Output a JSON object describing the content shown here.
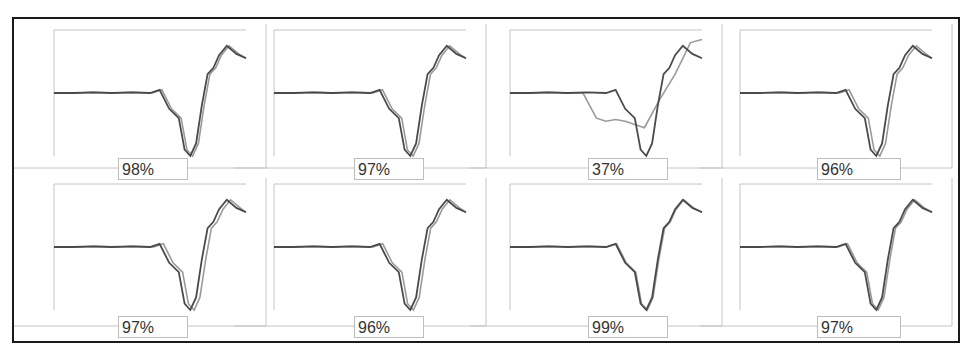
{
  "chart_data": {
    "type": "line",
    "title": "",
    "xlabel": "",
    "ylabel": "",
    "ylim": [
      -1,
      1
    ],
    "xlim": [
      0,
      1
    ],
    "grid": false,
    "legend": "none",
    "reference_shape": {
      "x": [
        0,
        0.1,
        0.2,
        0.3,
        0.4,
        0.5,
        0.55,
        0.6,
        0.65,
        0.68,
        0.71,
        0.74,
        0.77,
        0.8,
        0.83,
        0.86,
        0.9,
        0.95,
        1.0
      ],
      "y": [
        0,
        0,
        0.01,
        0,
        0.01,
        0,
        0.05,
        -0.25,
        -0.4,
        -0.9,
        -1.0,
        -0.8,
        -0.2,
        0.3,
        0.4,
        0.6,
        0.75,
        0.62,
        0.55
      ]
    },
    "panels": [
      {
        "label": "98%",
        "similarity": 98,
        "shift": 0.012,
        "row": 0,
        "col": 0
      },
      {
        "label": "97%",
        "similarity": 97,
        "shift": 0.015,
        "row": 0,
        "col": 1
      },
      {
        "label": "37%",
        "similarity": 37,
        "shift": 0.0,
        "row": 0,
        "col": 2,
        "mismatch": true
      },
      {
        "label": "96%",
        "similarity": 96,
        "shift": 0.018,
        "row": 0,
        "col": 3
      },
      {
        "label": "97%",
        "similarity": 97,
        "shift": 0.02,
        "row": 1,
        "col": 0
      },
      {
        "label": "96%",
        "similarity": 96,
        "shift": 0.016,
        "row": 1,
        "col": 1
      },
      {
        "label": "99%",
        "similarity": 99,
        "shift": 0.005,
        "row": 1,
        "col": 2
      },
      {
        "label": "97%",
        "similarity": 97,
        "shift": 0.01,
        "row": 1,
        "col": 3
      }
    ],
    "mismatch_trace": {
      "x": [
        0,
        0.1,
        0.2,
        0.3,
        0.38,
        0.45,
        0.5,
        0.55,
        0.6,
        0.65,
        0.7,
        0.78,
        0.86,
        0.94,
        1.0
      ],
      "y": [
        0,
        0,
        0.01,
        0,
        0.0,
        -0.4,
        -0.45,
        -0.42,
        -0.45,
        -0.5,
        -0.55,
        -0.1,
        0.3,
        0.8,
        0.85
      ]
    }
  },
  "colors": {
    "reference": "#4a4a4a",
    "test": "#9a9a9a",
    "frame": "#1a1a1a",
    "panel_border": "#c4c4c4"
  }
}
